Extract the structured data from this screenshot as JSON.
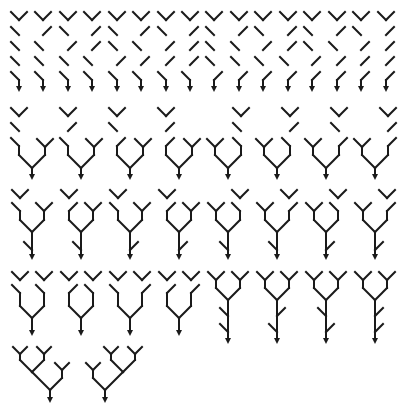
{
  "caption": "",
  "colors": {
    "stroke": "#1a1a1a",
    "background": "#ffffff"
  },
  "rows": [
    {
      "name": "row-1-caterpillars",
      "y_top": 12,
      "y_root": 90,
      "trees": [
        {
          "x": 19,
          "tree": "L(L(L(L(Y))))",
          "sides": [
            "L",
            "L",
            "L",
            "L"
          ]
        },
        {
          "x": 43,
          "sides": [
            "R",
            "L",
            "L",
            "L"
          ]
        },
        {
          "x": 68,
          "sides": [
            "L",
            "R",
            "L",
            "L"
          ]
        },
        {
          "x": 92,
          "sides": [
            "R",
            "R",
            "L",
            "L"
          ]
        },
        {
          "x": 117,
          "sides": [
            "L",
            "L",
            "R",
            "L"
          ]
        },
        {
          "x": 141,
          "sides": [
            "R",
            "L",
            "R",
            "L"
          ]
        },
        {
          "x": 166,
          "sides": [
            "L",
            "R",
            "R",
            "L"
          ]
        },
        {
          "x": 190,
          "sides": [
            "R",
            "R",
            "R",
            "L"
          ]
        },
        {
          "x": 214,
          "sides": [
            "L",
            "L",
            "L",
            "R"
          ]
        },
        {
          "x": 239,
          "sides": [
            "R",
            "L",
            "L",
            "R"
          ]
        },
        {
          "x": 263,
          "sides": [
            "L",
            "R",
            "L",
            "R"
          ]
        },
        {
          "x": 288,
          "sides": [
            "R",
            "R",
            "L",
            "R"
          ]
        },
        {
          "x": 312,
          "sides": [
            "L",
            "L",
            "R",
            "R"
          ]
        },
        {
          "x": 337,
          "sides": [
            "R",
            "L",
            "R",
            "R"
          ]
        },
        {
          "x": 361,
          "sides": [
            "L",
            "R",
            "R",
            "R"
          ]
        },
        {
          "x": 386,
          "sides": [
            "R",
            "R",
            "R",
            "R"
          ]
        }
      ]
    },
    {
      "name": "row-2",
      "trees": [
        {
          "x": 32,
          "y": 108,
          "spec": "[[[Y,L],L],[Y]]",
          "left_sides": [
            "L",
            "L"
          ],
          "right_sides": []
        },
        {
          "x": 81,
          "y": 108,
          "left_sides": [
            "R",
            "L"
          ],
          "right_sides": []
        },
        {
          "x": 130,
          "y": 108,
          "left_sides": [
            "L",
            "R"
          ],
          "right_sides": []
        },
        {
          "x": 179,
          "y": 108,
          "left_sides": [
            "R",
            "R"
          ],
          "right_sides": []
        },
        {
          "x": 228,
          "y": 108,
          "left_sides": [],
          "right_sides": [
            "L",
            "L"
          ]
        },
        {
          "x": 277,
          "y": 108,
          "left_sides": [],
          "right_sides": [
            "R",
            "L"
          ]
        },
        {
          "x": 326,
          "y": 108,
          "left_sides": [],
          "right_sides": [
            "L",
            "R"
          ]
        },
        {
          "x": 375,
          "y": 108,
          "left_sides": [],
          "right_sides": [
            "R",
            "R"
          ]
        }
      ]
    },
    {
      "name": "row-3",
      "trees": [
        {
          "x": 32,
          "y": 190,
          "left_sides": [
            "L"
          ],
          "right_sides": [],
          "stem_side": "L"
        },
        {
          "x": 81,
          "y": 190,
          "left_sides": [
            "R"
          ],
          "right_sides": [],
          "stem_side": "L"
        },
        {
          "x": 130,
          "y": 190,
          "left_sides": [
            "L"
          ],
          "right_sides": [],
          "stem_side": "R"
        },
        {
          "x": 179,
          "y": 190,
          "left_sides": [
            "R"
          ],
          "right_sides": [],
          "stem_side": "R"
        },
        {
          "x": 228,
          "y": 190,
          "left_sides": [],
          "right_sides": [
            "L"
          ],
          "stem_side": "L"
        },
        {
          "x": 277,
          "y": 190,
          "left_sides": [],
          "right_sides": [
            "R"
          ],
          "stem_side": "L"
        },
        {
          "x": 326,
          "y": 190,
          "left_sides": [],
          "right_sides": [
            "L"
          ],
          "stem_side": "R"
        },
        {
          "x": 375,
          "y": 190,
          "left_sides": [],
          "right_sides": [
            "R"
          ],
          "stem_side": "R"
        }
      ]
    },
    {
      "name": "row-4",
      "trees": [
        {
          "x": 32,
          "y": 272,
          "left_sides": [
            "L"
          ],
          "right_sides": [
            "L"
          ],
          "stem": []
        },
        {
          "x": 81,
          "y": 272,
          "left_sides": [
            "R"
          ],
          "right_sides": [
            "L"
          ],
          "stem": []
        },
        {
          "x": 130,
          "y": 272,
          "left_sides": [
            "L"
          ],
          "right_sides": [
            "R"
          ],
          "stem": []
        },
        {
          "x": 179,
          "y": 272,
          "left_sides": [
            "R"
          ],
          "right_sides": [
            "R"
          ],
          "stem": []
        },
        {
          "x": 228,
          "y": 272,
          "left_sides": [],
          "right_sides": [],
          "stem": [
            "L",
            "L"
          ]
        },
        {
          "x": 277,
          "y": 272,
          "left_sides": [],
          "right_sides": [],
          "stem": [
            "R",
            "L"
          ]
        },
        {
          "x": 326,
          "y": 272,
          "left_sides": [],
          "right_sides": [],
          "stem": [
            "L",
            "R"
          ]
        },
        {
          "x": 375,
          "y": 272,
          "left_sides": [],
          "right_sides": [],
          "stem": [
            "R",
            "R"
          ]
        }
      ]
    },
    {
      "name": "row-5",
      "trees": [
        {
          "x": 50,
          "y": 347,
          "variant": "deep-left"
        },
        {
          "x": 105,
          "y": 347,
          "variant": "deep-right"
        }
      ]
    }
  ],
  "tree_count": 42
}
